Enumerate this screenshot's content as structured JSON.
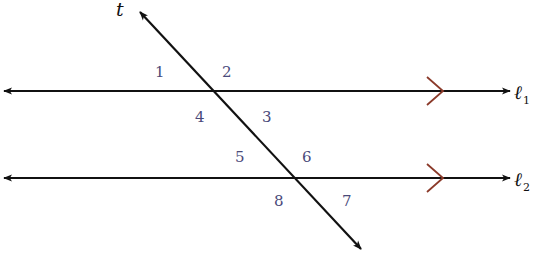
{
  "diagram": {
    "transversal": {
      "label": "t"
    },
    "lines": [
      {
        "name": "l1",
        "label": "ℓ",
        "subscript": "1"
      },
      {
        "name": "l2",
        "label": "ℓ",
        "subscript": "2"
      }
    ],
    "angles": [
      {
        "id": "1",
        "label": "1"
      },
      {
        "id": "2",
        "label": "2"
      },
      {
        "id": "3",
        "label": "3"
      },
      {
        "id": "4",
        "label": "4"
      },
      {
        "id": "5",
        "label": "5"
      },
      {
        "id": "6",
        "label": "6"
      },
      {
        "id": "7",
        "label": "7"
      },
      {
        "id": "8",
        "label": "8"
      }
    ],
    "colors": {
      "line": "#111111",
      "parallel_marker": "#8b3a2a",
      "angle_label": "#4a4a7a"
    }
  }
}
